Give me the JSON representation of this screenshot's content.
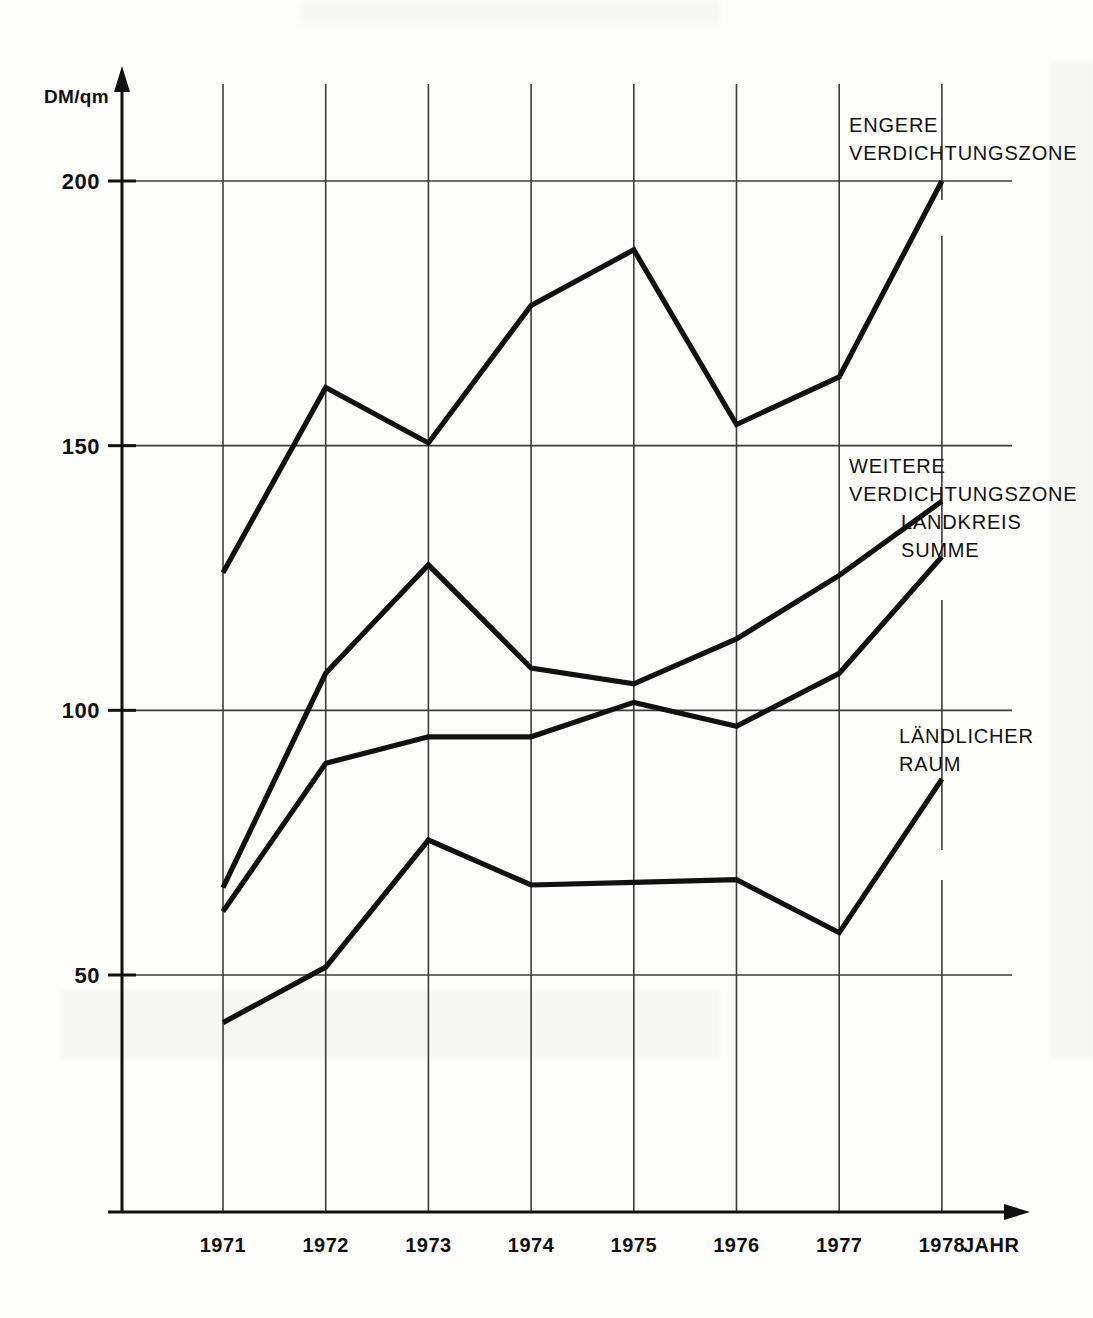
{
  "chart_data": {
    "type": "line",
    "title": "",
    "xlabel": "JAHR",
    "ylabel": "DM/qm",
    "categories": [
      "1971",
      "1972",
      "1973",
      "1974",
      "1975",
      "1976",
      "1977",
      "1978"
    ],
    "x": [
      1971,
      1972,
      1973,
      1974,
      1975,
      1976,
      1977,
      1978
    ],
    "xlim": [
      1970.3,
      1978.6
    ],
    "ylim": [
      0,
      215
    ],
    "yticks": [
      50,
      100,
      150,
      200
    ],
    "ytick_labels": [
      "50",
      "100",
      "150",
      "200"
    ],
    "grid": "both",
    "legend_position": "inline-right-annotations",
    "line_color": "#111111",
    "grid_color": "#4a4a4a",
    "axis_color": "#111111",
    "series": [
      {
        "name": "ENGERE VERDICHTUNGSZONE",
        "label_lines": [
          "ENGERE",
          "VERDICHTUNGSZONE"
        ],
        "values": [
          126,
          161,
          150.5,
          176.5,
          187,
          154,
          163,
          200
        ]
      },
      {
        "name": "WEITERE VERDICHTUNGSZONE",
        "label_lines": [
          "WEITERE",
          "VERDICHTUNGSZONE"
        ],
        "values": [
          66.5,
          107,
          127.5,
          108,
          105,
          113.5,
          125.5,
          139.5
        ]
      },
      {
        "name": "LANDKREIS SUMME",
        "label_lines": [
          "LANDKREIS",
          "SUMME"
        ],
        "values": [
          62,
          90,
          95,
          95,
          101.5,
          97,
          107,
          129
        ]
      },
      {
        "name": "LÄNDLICHER RAUM",
        "label_lines": [
          "LÄNDLICHER",
          "RAUM"
        ],
        "values": [
          41,
          51.5,
          75.5,
          67,
          67.5,
          68,
          58,
          87
        ]
      }
    ],
    "annotations": [
      {
        "id": "engere",
        "lines": [
          "ENGERE",
          "VERDICHTUNGSZONE"
        ],
        "x": 849,
        "y": 132
      },
      {
        "id": "weitere",
        "lines": [
          "WEITERE",
          "VERDICHTUNGSZONE"
        ],
        "x": 849,
        "y": 473
      },
      {
        "id": "landkreis-summe",
        "lines": [
          "LANDKREIS",
          "SUMME"
        ],
        "x": 901,
        "y": 529
      },
      {
        "id": "laendlicher-raum",
        "lines": [
          "LÄNDLICHER",
          "RAUM"
        ],
        "x": 899,
        "y": 743
      }
    ]
  },
  "axis": {
    "unit_label": "DM/qm",
    "x_name": "JAHR"
  }
}
